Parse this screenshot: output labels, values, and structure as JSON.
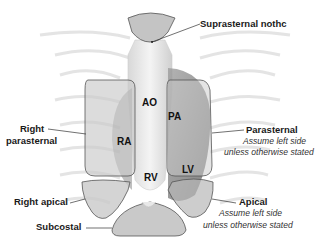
{
  "diagram": {
    "windows": [
      {
        "id": "suprasternal",
        "label": "Suprasternal nothc",
        "note": ""
      },
      {
        "id": "right-parasternal",
        "label_line1": "Right",
        "label_line2": "parasternal"
      },
      {
        "id": "parasternal",
        "label": "Parasternal",
        "note_line1": "Assume left side",
        "note_line2": "unless otherwise stated"
      },
      {
        "id": "right-apical",
        "label": "Right apical"
      },
      {
        "id": "apical",
        "label": "Apical",
        "note_line1": "Assume left side",
        "note_line2": "unless otherwise stated"
      },
      {
        "id": "subcostal",
        "label": "Subcostal"
      }
    ],
    "chambers": {
      "ao": "AO",
      "pa": "PA",
      "ra": "RA",
      "rv": "RV",
      "lv": "LV"
    },
    "colors": {
      "window_fill": "#c9c9c9",
      "window_stroke": "#555555",
      "heart": "#e8e8e8",
      "ribs": "#dcdcdc",
      "text": "#1a1a1a"
    }
  }
}
